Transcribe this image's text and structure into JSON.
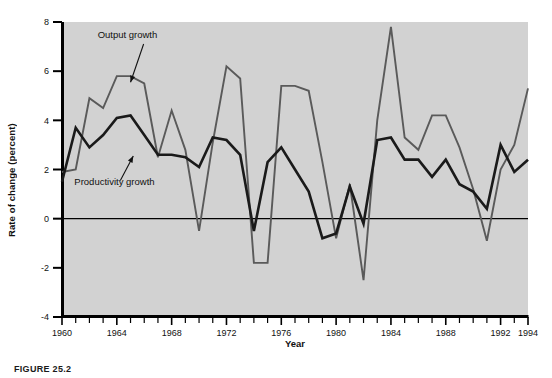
{
  "figure": {
    "caption": "FIGURE 25.2",
    "xlabel": "Year",
    "ylabel": "Rate of change (percent)"
  },
  "colors": {
    "plot_background": "#d2d2d2",
    "page_background": "#ffffff",
    "output_growth_line": "#5a5a5a",
    "productivity_growth_line": "#1a1a1a",
    "axis": "#000000",
    "zero_line": "#000000"
  },
  "chart_data": {
    "type": "line",
    "title": "",
    "xlabel": "Year",
    "ylabel": "Rate of change (percent)",
    "xlim": [
      1960,
      1994
    ],
    "ylim": [
      -4,
      8
    ],
    "yticks": [
      -4,
      -2,
      0,
      2,
      4,
      6,
      8
    ],
    "ytick_labels": [
      "-4",
      "-2",
      "0",
      "2",
      "4",
      "6",
      "8"
    ],
    "xticks": [
      1960,
      1964,
      1968,
      1972,
      1976,
      1980,
      1984,
      1988,
      1992,
      1994
    ],
    "xtick_labels": [
      "1960",
      "1964",
      "1968",
      "1972",
      "1976",
      "1980",
      "1984",
      "1988",
      "1992",
      "1994"
    ],
    "minor_xtick_interval": 1,
    "grid": false,
    "legend": "annotations",
    "annotations": [
      {
        "text": "Output growth",
        "series": "Output growth",
        "text_x": 1962.6,
        "text_y": 7.35,
        "arrow_to_x": 1965.0,
        "arrow_to_y": 5.55
      },
      {
        "text": "Productivity growth",
        "series": "Productivity growth",
        "text_x": 1960.9,
        "text_y": 1.35,
        "arrow_to_x": 1965.2,
        "arrow_to_y": 2.55
      }
    ],
    "x": [
      1960,
      1961,
      1962,
      1963,
      1964,
      1965,
      1966,
      1967,
      1968,
      1969,
      1970,
      1971,
      1972,
      1973,
      1974,
      1975,
      1976,
      1977,
      1978,
      1979,
      1980,
      1981,
      1982,
      1983,
      1984,
      1985,
      1986,
      1987,
      1988,
      1989,
      1990,
      1991,
      1992,
      1993,
      1994
    ],
    "series": [
      {
        "name": "Output growth",
        "color": "#5a5a5a",
        "values": [
          1.9,
          2.0,
          4.9,
          4.5,
          5.8,
          5.8,
          5.5,
          2.5,
          4.4,
          2.8,
          -0.5,
          3.1,
          6.2,
          5.7,
          -1.8,
          -1.8,
          5.4,
          5.4,
          5.2,
          2.3,
          -0.8,
          1.4,
          -2.5,
          4.0,
          7.8,
          3.3,
          2.8,
          4.2,
          4.2,
          2.9,
          1.2,
          -0.9,
          2.0,
          3.0,
          5.3
        ]
      },
      {
        "name": "Productivity growth",
        "color": "#1a1a1a",
        "values": [
          1.5,
          3.7,
          2.9,
          3.4,
          4.1,
          4.2,
          3.4,
          2.6,
          2.6,
          2.5,
          2.1,
          3.3,
          3.2,
          2.6,
          -0.5,
          2.3,
          2.9,
          2.0,
          1.1,
          -0.8,
          -0.6,
          1.3,
          -0.2,
          3.2,
          3.3,
          2.4,
          2.4,
          1.7,
          2.4,
          1.4,
          1.1,
          0.4,
          3.0,
          1.9,
          2.4
        ]
      }
    ]
  }
}
